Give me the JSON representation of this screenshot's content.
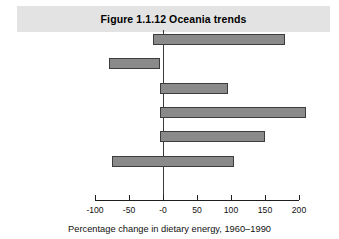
{
  "figure": {
    "title": "Figure 1.1.12  Oceania trends"
  },
  "chart_data": {
    "type": "bar",
    "orientation": "horizontal",
    "title": "Figure 1.1.12  Oceania trends",
    "xlabel": "Percentage change in dietary energy, 1960–1990",
    "ylabel": "",
    "categories": [
      "Cereals",
      "Vegetables\nand fruits",
      "Meat",
      "Milk",
      "Added fats",
      "Alcohol"
    ],
    "values": [
      180,
      -5,
      95,
      210,
      150,
      105
    ],
    "bar_starts": [
      -15,
      -80,
      -5,
      -5,
      -5,
      -75
    ],
    "bar_ends": [
      180,
      -5,
      95,
      210,
      150,
      105
    ],
    "xlim": [
      -100,
      200
    ],
    "xticks": [
      -100,
      -50,
      0,
      50,
      100,
      150,
      200
    ],
    "xtick_labels": [
      "-100",
      "-50",
      "-0",
      "50",
      "100",
      "150",
      "200"
    ],
    "grid": false,
    "legend": false,
    "bar_color": "#8a8a8a",
    "bar_edge_color": "#3d3d3d",
    "banner_color": "#e3e3e3"
  },
  "axis": {
    "label": "Percentage change in dietary energy, 1960–1990"
  }
}
